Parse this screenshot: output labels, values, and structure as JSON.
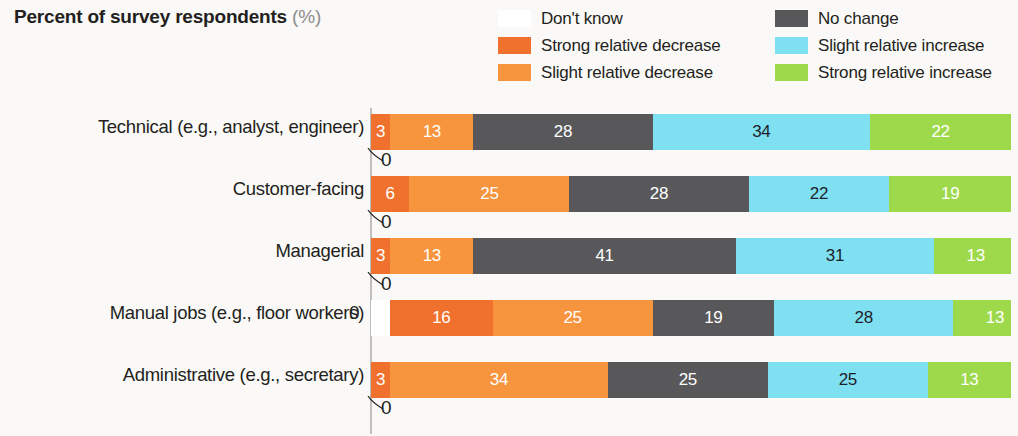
{
  "header": {
    "title": "Percent of survey respondents",
    "unit": "(%)"
  },
  "legend": {
    "items": [
      {
        "label": "Don't know",
        "color": "#ffffff"
      },
      {
        "label": "No change",
        "color": "#58585a"
      },
      {
        "label": "Strong relative decrease",
        "color": "#f0712e"
      },
      {
        "label": "Slight relative increase",
        "color": "#7fe0f2"
      },
      {
        "label": "Slight relative decrease",
        "color": "#f7943e"
      },
      {
        "label": "Strong relative increase",
        "color": "#9ed94c"
      }
    ]
  },
  "chart_data": {
    "type": "bar",
    "title": "Percent of survey respondents (%)",
    "xlabel": "",
    "ylabel": "",
    "xlim": [
      0,
      100
    ],
    "grid": false,
    "legend_position": "top-right",
    "stacked": true,
    "orientation": "horizontal",
    "categories": [
      "Technical (e.g., analyst, engineer)",
      "Customer-facing",
      "Managerial",
      "Manual jobs (e.g., floor workers)",
      "Administrative (e.g., secretary)"
    ],
    "series": [
      {
        "name": "Don't know",
        "color": "#ffffff",
        "values": [
          0,
          0,
          0,
          0,
          0
        ]
      },
      {
        "name": "Strong relative decrease",
        "color": "#f0712e",
        "values": [
          3,
          6,
          3,
          16,
          3
        ]
      },
      {
        "name": "Slight relative decrease",
        "color": "#f7943e",
        "values": [
          13,
          25,
          13,
          25,
          34
        ]
      },
      {
        "name": "No change",
        "color": "#58585a",
        "values": [
          28,
          28,
          41,
          19,
          25
        ]
      },
      {
        "name": "Slight relative increase",
        "color": "#7fe0f2",
        "values": [
          34,
          22,
          31,
          28,
          25
        ]
      },
      {
        "name": "Strong relative increase",
        "color": "#9ed94c",
        "values": [
          22,
          19,
          13,
          13,
          13
        ]
      }
    ]
  },
  "rows": [
    {
      "label": "Technical (e.g., analyst, engineer)",
      "zero_label": "0",
      "zero_outside": false,
      "segments": [
        {
          "series": "Don't know",
          "value": 0,
          "display": "",
          "color": "#ffffff",
          "text": "none"
        },
        {
          "series": "Strong relative decrease",
          "value": 3,
          "display": "3",
          "color": "#f0712e",
          "text": "light"
        },
        {
          "series": "Slight relative decrease",
          "value": 13,
          "display": "13",
          "color": "#f7943e",
          "text": "light"
        },
        {
          "series": "No change",
          "value": 28,
          "display": "28",
          "color": "#58585a",
          "text": "light"
        },
        {
          "series": "Slight relative increase",
          "value": 34,
          "display": "34",
          "color": "#7fe0f2",
          "text": "dark"
        },
        {
          "series": "Strong relative increase",
          "value": 22,
          "display": "22",
          "color": "#9ed94c",
          "text": "light"
        }
      ]
    },
    {
      "label": "Customer-facing",
      "zero_label": "0",
      "zero_outside": false,
      "segments": [
        {
          "series": "Don't know",
          "value": 0,
          "display": "",
          "color": "#ffffff",
          "text": "none"
        },
        {
          "series": "Strong relative decrease",
          "value": 6,
          "display": "6",
          "color": "#f0712e",
          "text": "light"
        },
        {
          "series": "Slight relative decrease",
          "value": 25,
          "display": "25",
          "color": "#f7943e",
          "text": "light"
        },
        {
          "series": "No change",
          "value": 28,
          "display": "28",
          "color": "#58585a",
          "text": "light"
        },
        {
          "series": "Slight relative increase",
          "value": 22,
          "display": "22",
          "color": "#7fe0f2",
          "text": "dark"
        },
        {
          "series": "Strong relative increase",
          "value": 19,
          "display": "19",
          "color": "#9ed94c",
          "text": "light"
        }
      ]
    },
    {
      "label": "Managerial",
      "zero_label": "0",
      "zero_outside": false,
      "segments": [
        {
          "series": "Don't know",
          "value": 0,
          "display": "",
          "color": "#ffffff",
          "text": "none"
        },
        {
          "series": "Strong relative decrease",
          "value": 3,
          "display": "3",
          "color": "#f0712e",
          "text": "light"
        },
        {
          "series": "Slight relative decrease",
          "value": 13,
          "display": "13",
          "color": "#f7943e",
          "text": "light"
        },
        {
          "series": "No change",
          "value": 41,
          "display": "41",
          "color": "#58585a",
          "text": "light"
        },
        {
          "series": "Slight relative increase",
          "value": 31,
          "display": "31",
          "color": "#7fe0f2",
          "text": "dark"
        },
        {
          "series": "Strong relative increase",
          "value": 13,
          "display": "13",
          "color": "#9ed94c",
          "text": "light"
        }
      ]
    },
    {
      "label": "Manual jobs (e.g., floor workers)",
      "zero_label": "0",
      "zero_outside": true,
      "segments": [
        {
          "series": "Don't know",
          "value": 3,
          "display": "",
          "color": "#ffffff",
          "text": "none"
        },
        {
          "series": "Strong relative decrease",
          "value": 16,
          "display": "16",
          "color": "#f0712e",
          "text": "light"
        },
        {
          "series": "Slight relative decrease",
          "value": 25,
          "display": "25",
          "color": "#f7943e",
          "text": "light"
        },
        {
          "series": "No change",
          "value": 19,
          "display": "19",
          "color": "#58585a",
          "text": "light"
        },
        {
          "series": "Slight relative increase",
          "value": 28,
          "display": "28",
          "color": "#7fe0f2",
          "text": "dark"
        },
        {
          "series": "Strong relative increase",
          "value": 13,
          "display": "13",
          "color": "#9ed94c",
          "text": "light"
        }
      ]
    },
    {
      "label": "Administrative (e.g., secretary)",
      "zero_label": "0",
      "zero_outside": false,
      "segments": [
        {
          "series": "Don't know",
          "value": 0,
          "display": "",
          "color": "#ffffff",
          "text": "none"
        },
        {
          "series": "Strong relative decrease",
          "value": 3,
          "display": "3",
          "color": "#f0712e",
          "text": "light"
        },
        {
          "series": "Slight relative decrease",
          "value": 34,
          "display": "34",
          "color": "#f7943e",
          "text": "light"
        },
        {
          "series": "No change",
          "value": 25,
          "display": "25",
          "color": "#58585a",
          "text": "light"
        },
        {
          "series": "Slight relative increase",
          "value": 25,
          "display": "25",
          "color": "#7fe0f2",
          "text": "dark"
        },
        {
          "series": "Strong relative increase",
          "value": 13,
          "display": "13",
          "color": "#9ed94c",
          "text": "light"
        }
      ]
    }
  ]
}
